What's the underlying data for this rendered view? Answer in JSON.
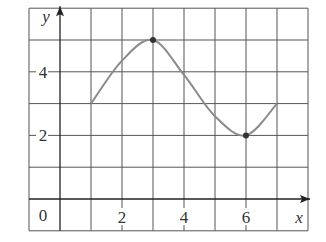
{
  "chart_data": {
    "type": "line",
    "title": "",
    "xlabel": "x",
    "ylabel": "y",
    "xlim": [
      -1,
      8
    ],
    "ylim": [
      -1,
      6
    ],
    "grid": true,
    "grid_step": 1,
    "x_ticks": [
      0,
      2,
      4,
      6
    ],
    "x_tick_labels": [
      "0",
      "2",
      "4",
      "6"
    ],
    "y_ticks": [
      2,
      4
    ],
    "y_tick_labels": [
      "2",
      "4"
    ],
    "origin_label": "0",
    "series": [
      {
        "name": "f(x)",
        "color": "#8a8a8a",
        "points": [
          [
            1,
            3
          ],
          [
            2,
            4.35
          ],
          [
            3,
            5
          ],
          [
            4,
            3.9
          ],
          [
            5,
            2.6
          ],
          [
            6,
            2
          ],
          [
            7,
            3
          ]
        ],
        "marked_points": [
          [
            3,
            5
          ],
          [
            6,
            2
          ]
        ]
      }
    ],
    "legend": "none"
  },
  "colors": {
    "grid": "#555555",
    "axis": "#222222",
    "curve": "#8a8a8a",
    "dot": "#333333"
  }
}
